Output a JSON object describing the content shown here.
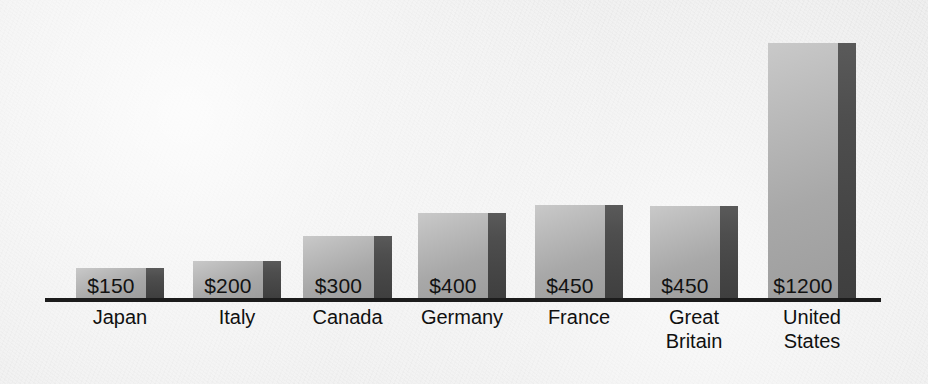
{
  "chart_data": {
    "type": "bar",
    "title": "",
    "subtitle": "",
    "xlabel": "",
    "ylabel": "",
    "grid": false,
    "legend": "none",
    "value_prefix": "$",
    "categories": [
      "Japan",
      "Italy",
      "Canada",
      "Germany",
      "France",
      "Great\nBritain",
      "United\nStates"
    ],
    "values": [
      150,
      200,
      300,
      400,
      450,
      450,
      1200
    ],
    "value_labels": [
      "$150",
      "$200",
      "$300",
      "$400",
      "$450",
      "$450",
      "$1200"
    ],
    "ylim": [
      0,
      1200
    ],
    "axis_visible": true
  },
  "style": {
    "background": "#eeeeee",
    "axis_color": "#1c1c1c",
    "bar_face_light": "#c9c9c9",
    "bar_face_dark": "#9d9d9d",
    "bar_side_color": "#474747",
    "label_color": "#101010"
  },
  "bars": [
    {
      "name": "japan",
      "label": "Japan",
      "value_label": "$150",
      "left": 76,
      "width": 88,
      "side_width": 18,
      "top": 268,
      "label_left": 56,
      "label_top": 306,
      "label_width": 128
    },
    {
      "name": "italy",
      "label": "Italy",
      "value_label": "$200",
      "left": 193,
      "width": 88,
      "side_width": 18,
      "top": 261,
      "label_left": 173,
      "label_top": 306,
      "label_width": 128
    },
    {
      "name": "canada",
      "label": "Canada",
      "value_label": "$300",
      "left": 303,
      "width": 89,
      "side_width": 18,
      "top": 236,
      "label_left": 283,
      "label_top": 306,
      "label_width": 129
    },
    {
      "name": "germany",
      "label": "Germany",
      "value_label": "$400",
      "left": 418,
      "width": 88,
      "side_width": 18,
      "top": 213,
      "label_left": 396,
      "label_top": 306,
      "label_width": 132
    },
    {
      "name": "france",
      "label": "France",
      "value_label": "$450",
      "left": 535,
      "width": 88,
      "side_width": 18,
      "top": 205,
      "label_left": 515,
      "label_top": 306,
      "label_width": 128
    },
    {
      "name": "great-britain",
      "label": "Great\nBritain",
      "value_label": "$450",
      "left": 650,
      "width": 88,
      "side_width": 18,
      "top": 206,
      "label_left": 630,
      "label_top": 306,
      "label_width": 128
    },
    {
      "name": "united-states",
      "label": "United\nStates",
      "value_label": "$1200",
      "left": 768,
      "width": 88,
      "side_width": 18,
      "top": 43,
      "label_left": 748,
      "label_top": 306,
      "label_width": 128
    }
  ],
  "axis": {
    "left": 45,
    "right": 881,
    "y": 298,
    "thickness": 4
  }
}
